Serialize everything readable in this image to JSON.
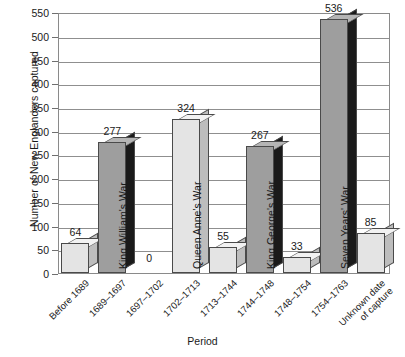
{
  "chart_data": {
    "type": "bar",
    "title": "",
    "xlabel": "Period",
    "ylabel": "Number of New Englanders captured",
    "ylim": [
      0,
      550
    ],
    "ytick_step": 50,
    "yticks": [
      0,
      50,
      100,
      150,
      200,
      250,
      300,
      350,
      400,
      450,
      500,
      550
    ],
    "grid": "horizontal",
    "legend": "none",
    "style": "3d-bar",
    "categories": [
      "Before 1689",
      "1689–1697",
      "1697–1702",
      "1702–1713",
      "1713–1744",
      "1744–1748",
      "1748–1754",
      "1754–1763",
      "Unknown date\nof capture"
    ],
    "values": [
      64,
      277,
      0,
      324,
      55,
      267,
      33,
      536,
      85
    ],
    "bar_annotations": [
      {
        "index": 0,
        "value": 64,
        "war": "",
        "shade": "light"
      },
      {
        "index": 1,
        "value": 277,
        "war": "King William's War",
        "shade": "dark"
      },
      {
        "index": 2,
        "value": 0,
        "war": "",
        "shade": "light"
      },
      {
        "index": 3,
        "value": 324,
        "war": "Queen Anne's War",
        "shade": "light"
      },
      {
        "index": 4,
        "value": 55,
        "war": "",
        "shade": "light"
      },
      {
        "index": 5,
        "value": 267,
        "war": "King George's War",
        "shade": "dark"
      },
      {
        "index": 6,
        "value": 33,
        "war": "",
        "shade": "light"
      },
      {
        "index": 7,
        "value": 536,
        "war": "Seven Years' War",
        "shade": "dark"
      },
      {
        "index": 8,
        "value": 85,
        "war": "",
        "shade": "light"
      }
    ],
    "colors": {
      "light_face": "#e4e4e4",
      "light_side": "#bdbdbd",
      "dark_face": "#9e9e9e",
      "dark_side": "#1a1a1a",
      "gridline": "#8f8f8f",
      "axis": "#8a8a8a",
      "text": "#1a1a1a",
      "background": "#ffffff"
    }
  },
  "axis": {
    "y_title": "Number of New Englanders captured",
    "x_title": "Period",
    "y_ticks": [
      "550",
      "500",
      "450",
      "400",
      "350",
      "300",
      "250",
      "200",
      "150",
      "100",
      "50",
      "0"
    ]
  },
  "xlabels": [
    "Before 1689",
    "1689–1697",
    "1697–1702",
    "1702–1713",
    "1713–1744",
    "1744–1748",
    "1748–1754",
    "1754–1763",
    "Unknown date of capture"
  ],
  "values_text": [
    "64",
    "277",
    "0",
    "324",
    "55",
    "267",
    "33",
    "536",
    "85"
  ],
  "war_labels": {
    "b1": "King William's War",
    "b3": "Queen Anne's War",
    "b5": "King George's War",
    "b7": "Seven Years' War"
  }
}
